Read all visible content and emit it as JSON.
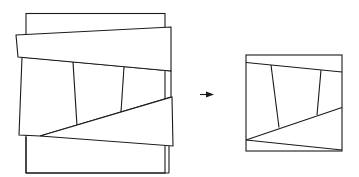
{
  "diagram": {
    "title": "",
    "figures": [
      {
        "id": "source-figure",
        "label": "",
        "parts": [
          "outer-rectangle",
          "upper-tilted-band",
          "middle-quadrilateral-region",
          "lower-triangular-wedge",
          "inner-divider-lines"
        ]
      },
      {
        "id": "result-square",
        "label": "",
        "parts": [
          "square-outline",
          "upper-diagonal",
          "lower-diagonal",
          "bottom-diagonal",
          "inner-divider-lines"
        ]
      }
    ],
    "transition": {
      "icon": "arrow-right-icon",
      "meaning": "transforms into"
    },
    "colors": {
      "stroke": "#1a1a1a",
      "background": "#ffffff"
    }
  }
}
